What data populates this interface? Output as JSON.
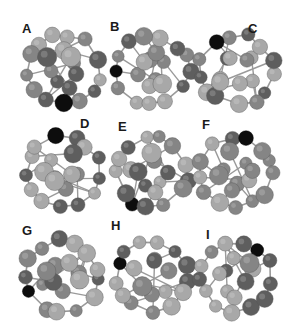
{
  "figure": {
    "panels": [
      {
        "label": "A",
        "label_pos": [
          22,
          22
        ],
        "origin": [
          14,
          14
        ],
        "dark_index": 3
      },
      {
        "label": "B",
        "label_pos": [
          110,
          20
        ],
        "origin": [
          104,
          14
        ],
        "dark_index": 6
      },
      {
        "label": "C",
        "label_pos": [
          248,
          22
        ],
        "origin": [
          188,
          14
        ],
        "dark_index": 8
      },
      {
        "label": "D",
        "label_pos": [
          80,
          117
        ],
        "origin": [
          14,
          116
        ],
        "dark_index": 9
      },
      {
        "label": "E",
        "label_pos": [
          118,
          120
        ],
        "origin": [
          104,
          116
        ],
        "dark_index": 4
      },
      {
        "label": "F",
        "label_pos": [
          202,
          118
        ],
        "origin": [
          188,
          116
        ],
        "dark_index": 10
      },
      {
        "label": "G",
        "label_pos": [
          22,
          224
        ],
        "origin": [
          14,
          220
        ],
        "dark_index": 5
      },
      {
        "label": "H",
        "label_pos": [
          111,
          219
        ],
        "origin": [
          104,
          220
        ],
        "dark_index": 7
      },
      {
        "label": "I",
        "label_pos": [
          206,
          228
        ],
        "origin": [
          188,
          220
        ],
        "dark_index": 11
      }
    ],
    "colors": {
      "dark_atom": "#0d0d0d",
      "gray_light": "#a8a8a8",
      "gray_mid": "#858585",
      "gray_dark": "#5e5e5e",
      "bond": "#9a9a9a",
      "label": "#1a1a1a"
    }
  }
}
